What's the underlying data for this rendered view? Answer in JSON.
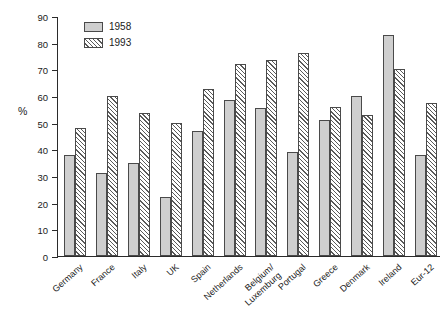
{
  "chart_data": {
    "type": "bar",
    "title": "",
    "xlabel": "",
    "ylabel": "%",
    "ylim": [
      0,
      90
    ],
    "ytick_step": 10,
    "yticks": [
      90,
      80,
      70,
      60,
      50,
      40,
      30,
      20,
      10,
      0
    ],
    "grid": false,
    "legend_position": "top-left",
    "categories": [
      "Germany",
      "France",
      "Italy",
      "UK",
      "Spain",
      "Netherlands",
      "Belgium/ Luxemburg",
      "Portugal",
      "Greece",
      "Denmark",
      "Ireland",
      "Eur-12"
    ],
    "category_lines": [
      [
        "Germany"
      ],
      [
        "France"
      ],
      [
        "Italy"
      ],
      [
        "UK"
      ],
      [
        "Spain"
      ],
      [
        "Netherlands"
      ],
      [
        "Belgium/",
        "Luxemburg"
      ],
      [
        "Portugal"
      ],
      [
        "Greece"
      ],
      [
        "Denmark"
      ],
      [
        "Ireland"
      ],
      [
        "Eur-12"
      ]
    ],
    "series": [
      {
        "name": "1958",
        "style": "solid-gray",
        "color": "#cfcfcf",
        "values": [
          38,
          31,
          35,
          22,
          47,
          58.5,
          55.5,
          39,
          51,
          60,
          83,
          38
        ]
      },
      {
        "name": "1993",
        "style": "diagonal-hatch",
        "color": "#ffffff",
        "values": [
          48,
          60,
          53.5,
          50,
          62.5,
          72,
          73.5,
          76,
          56,
          53,
          70,
          57.5
        ]
      }
    ]
  },
  "legend": {
    "items": [
      {
        "label": "1958"
      },
      {
        "label": "1993"
      }
    ]
  }
}
